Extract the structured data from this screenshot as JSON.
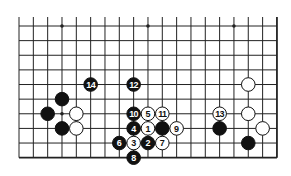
{
  "diagram": {
    "type": "go-board-diagram",
    "board_size": 19,
    "visible_region": "bottom portion, right edge and bottom edge visible",
    "visible_columns": 19,
    "visible_rows": 10,
    "colors": {
      "background": "#ffffff",
      "line": "#222222",
      "black_stone": "#111111",
      "white_stone": "#ffffff",
      "black_label": "#ffffff",
      "white_label": "#111111"
    },
    "star_points": [
      {
        "col": 3,
        "row": 0
      },
      {
        "col": 9,
        "row": 0
      },
      {
        "col": 15,
        "row": 0
      },
      {
        "col": 3,
        "row": 6
      }
    ],
    "stones": [
      {
        "color": "black",
        "col": 5,
        "row": 4,
        "label": "14"
      },
      {
        "color": "black",
        "col": 8,
        "row": 4,
        "label": "12"
      },
      {
        "color": "white",
        "col": 16,
        "row": 4,
        "label": ""
      },
      {
        "color": "black",
        "col": 3,
        "row": 5,
        "label": ""
      },
      {
        "color": "black",
        "col": 2,
        "row": 6,
        "label": ""
      },
      {
        "color": "white",
        "col": 4,
        "row": 6,
        "label": ""
      },
      {
        "color": "black",
        "col": 8,
        "row": 6,
        "label": "10"
      },
      {
        "color": "white",
        "col": 9,
        "row": 6,
        "label": "5"
      },
      {
        "color": "white",
        "col": 10,
        "row": 6,
        "label": "11"
      },
      {
        "color": "white",
        "col": 14,
        "row": 6,
        "label": "13"
      },
      {
        "color": "white",
        "col": 16,
        "row": 6,
        "label": ""
      },
      {
        "color": "black",
        "col": 3,
        "row": 7,
        "label": ""
      },
      {
        "color": "white",
        "col": 4,
        "row": 7,
        "label": ""
      },
      {
        "color": "black",
        "col": 8,
        "row": 7,
        "label": "4"
      },
      {
        "color": "white",
        "col": 9,
        "row": 7,
        "label": "1"
      },
      {
        "color": "black",
        "col": 10,
        "row": 7,
        "label": ""
      },
      {
        "color": "white",
        "col": 11,
        "row": 7,
        "label": "9"
      },
      {
        "color": "black",
        "col": 14,
        "row": 7,
        "label": ""
      },
      {
        "color": "white",
        "col": 17,
        "row": 7,
        "label": ""
      },
      {
        "color": "black",
        "col": 7,
        "row": 8,
        "label": "6"
      },
      {
        "color": "white",
        "col": 8,
        "row": 8,
        "label": "3"
      },
      {
        "color": "black",
        "col": 9,
        "row": 8,
        "label": "2"
      },
      {
        "color": "white",
        "col": 10,
        "row": 8,
        "label": "7"
      },
      {
        "color": "black",
        "col": 16,
        "row": 8,
        "label": ""
      },
      {
        "color": "black",
        "col": 8,
        "row": 9,
        "label": "8"
      }
    ]
  }
}
